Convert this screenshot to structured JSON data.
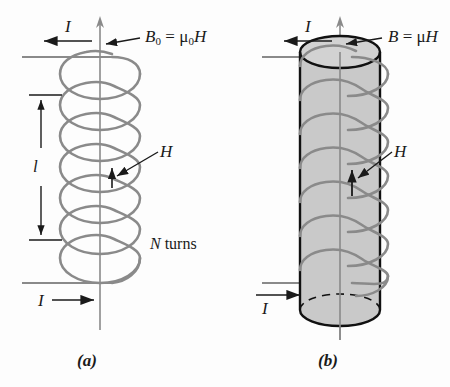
{
  "figure": {
    "background_color": "#fdfdfd",
    "coil_color": "#8a8a8a",
    "core_fill_color": "#c9c9c9",
    "core_outline_color": "#111111",
    "text_color": "#1a1a1a"
  },
  "panel_a": {
    "caption": "(a)",
    "field_label": "B",
    "field_label_subscript": "0",
    "field_equals": "=",
    "field_mu": "μ",
    "field_mu_subscript": "0",
    "field_H": "H",
    "field_full": "B₀ = μ₀H",
    "current_top_label": "I",
    "current_top_arrow": "←",
    "current_bottom_label": "I",
    "current_bottom_arrow": "→",
    "length_label": "l",
    "h_label": "H",
    "turns_label_symbol": "N",
    "turns_label_word": "turns",
    "turns_label_full": "N turns",
    "turn_count": 7
  },
  "panel_b": {
    "caption": "(b)",
    "field_label": "B",
    "field_equals": "=",
    "field_mu": "μ",
    "field_H": "H",
    "field_full": "B = μH",
    "current_top_label": "I",
    "current_top_arrow": "←",
    "current_bottom_label": "I",
    "current_bottom_arrow": "→",
    "h_label": "H",
    "turn_count": 7
  }
}
